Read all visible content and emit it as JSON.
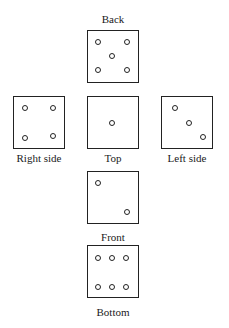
{
  "diagram": {
    "type": "die-net",
    "faces": [
      {
        "name": "Back",
        "label": "Back",
        "pips": 5
      },
      {
        "name": "Right side",
        "label": "Right side",
        "pips": 4
      },
      {
        "name": "Top",
        "label": "Top",
        "pips": 1
      },
      {
        "name": "Left side",
        "label": "Left side",
        "pips": 3
      },
      {
        "name": "Front",
        "label": "Front",
        "pips": 2
      },
      {
        "name": "Bottom",
        "label": "Bottom",
        "pips": 6
      }
    ]
  }
}
